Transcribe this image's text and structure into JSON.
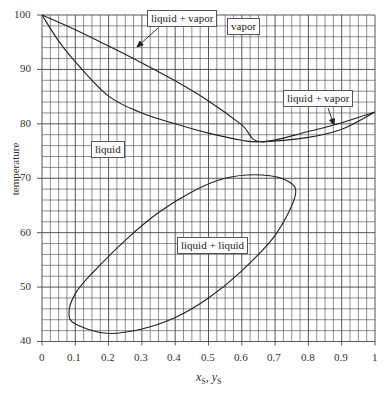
{
  "chart_data": {
    "type": "line",
    "title": "",
    "xlabel": "x_S, y_S",
    "ylabel": "temperature",
    "xlim": [
      0,
      1
    ],
    "ylim": [
      40,
      100
    ],
    "grid": true,
    "x_ticks": [
      "0",
      "0.1",
      "0.2",
      "0.3",
      "0.4",
      "0.5",
      "0.6",
      "0.7",
      "0.8",
      "0.9",
      "1"
    ],
    "y_ticks": [
      "40",
      "50",
      "60",
      "70",
      "80",
      "90",
      "100"
    ],
    "series": [
      {
        "name": "dew curve (vapor)",
        "x": [
          0,
          0.1,
          0.2,
          0.3,
          0.4,
          0.5,
          0.6,
          0.655,
          0.8,
          0.9,
          1.0
        ],
        "y": [
          100,
          97.3,
          94.3,
          91.2,
          87.9,
          84.2,
          79.8,
          76.7,
          78.6,
          80.2,
          82.2
        ]
      },
      {
        "name": "bubble curve (liquid)",
        "x": [
          0,
          0.05,
          0.1,
          0.2,
          0.3,
          0.4,
          0.5,
          0.6,
          0.655,
          0.8,
          0.9,
          1.0
        ],
        "y": [
          100,
          95.2,
          91.4,
          85.1,
          82.0,
          80.0,
          78.3,
          77.0,
          76.7,
          77.5,
          79.0,
          82.2
        ]
      },
      {
        "name": "liquid-liquid envelope",
        "x": [
          0.081,
          0.1,
          0.195,
          0.3,
          0.4,
          0.5,
          0.6,
          0.7,
          0.76,
          0.74,
          0.66,
          0.55,
          0.45,
          0.35,
          0.25,
          0.15,
          0.1,
          0.081
        ],
        "y": [
          45.3,
          43.2,
          41.5,
          42.3,
          44.4,
          48.0,
          53.0,
          59.5,
          66.7,
          69.4,
          70.6,
          70.0,
          67.5,
          63.7,
          58.6,
          52.5,
          48.8,
          45.3
        ]
      }
    ],
    "annotations": [
      {
        "text": "liquid + vapor",
        "region": "upper lens"
      },
      {
        "text": "vapor",
        "region": "above dew curve"
      },
      {
        "text": "liquid + vapor",
        "region": "right lens"
      },
      {
        "text": "liquid",
        "region": "below bubble curve"
      },
      {
        "text": "liquid + liquid",
        "region": "inside ellipse"
      }
    ]
  },
  "labels": {
    "lv_upper": "liquid + vapor",
    "vapor": "vapor",
    "lv_right": "liquid + vapor",
    "liquid": "liquid",
    "ll": "liquid + liquid"
  },
  "axes": {
    "ylabel": "temperature",
    "xlabel_main1": "x",
    "xlabel_sub1": "S",
    "xlabel_sep": ", ",
    "xlabel_main2": "y",
    "xlabel_sub2": "S",
    "x_ticks": [
      "0",
      "0.1",
      "0.2",
      "0.3",
      "0.4",
      "0.5",
      "0.6",
      "0.7",
      "0.8",
      "0.9",
      "1"
    ],
    "y_ticks": [
      "100",
      "90",
      "80",
      "70",
      "60",
      "50",
      "40"
    ]
  }
}
